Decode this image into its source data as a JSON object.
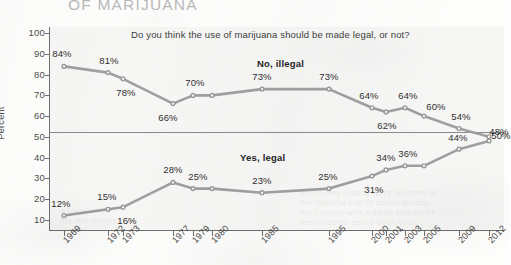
{
  "headline": "OF MARIJUANA",
  "subtitle": "Do you think the use of marijuana should be made legal, or not?",
  "axis": {
    "y_title": "Percent",
    "y_ticks": [
      "100",
      "90",
      "80",
      "70",
      "60",
      "50",
      "40",
      "30",
      "20",
      "10"
    ],
    "x_ticks": [
      "1969",
      "1972",
      "1973",
      "1977",
      "1979",
      "1980",
      "1985",
      "1995",
      "2000",
      "2001",
      "2003",
      "2005",
      "2009",
      "2012"
    ]
  },
  "series_labels": {
    "no": "No, illegal",
    "yes": "Yes, legal"
  },
  "colors": {
    "line": "#9a9a9a",
    "headline": "#b9b9b9",
    "axis": "#6f6f6f",
    "plot_background": "#f6f6f5",
    "text": "#2e2e2e"
  },
  "value_labels_no": [
    "84%",
    "81%",
    "78%",
    "66%",
    "70%",
    "",
    "73%",
    "73%",
    "64%",
    "62%",
    "64%",
    "60%",
    "54%",
    "50%"
  ],
  "value_labels_yes": [
    "12%",
    "15%",
    "16%",
    "28%",
    "25%",
    "",
    "23%",
    "25%",
    "31%",
    "34%",
    "36%",
    "",
    "44%",
    "48%"
  ],
  "chart_data": {
    "type": "line",
    "title": "OF MARIJUANA",
    "subtitle": "Do you think the use of marijuana should be made legal, or not?",
    "xlabel": "",
    "ylabel": "Percent",
    "ylim": [
      5,
      100
    ],
    "yticks": [
      10,
      20,
      30,
      40,
      50,
      60,
      70,
      80,
      90,
      100
    ],
    "grid": false,
    "legend_position": "inline-labels",
    "reference_line": 50,
    "x": [
      "1969",
      "1972",
      "1973",
      "1977",
      "1979",
      "1980",
      "1985",
      "1995",
      "2000",
      "2001",
      "2003",
      "2005",
      "2009",
      "2012"
    ],
    "series": [
      {
        "name": "No, illegal",
        "values": [
          84,
          81,
          78,
          66,
          70,
          70,
          73,
          73,
          64,
          62,
          64,
          60,
          54,
          50
        ]
      },
      {
        "name": "Yes, legal",
        "values": [
          12,
          15,
          16,
          28,
          25,
          25,
          23,
          25,
          31,
          34,
          36,
          36,
          44,
          48
        ]
      }
    ]
  }
}
